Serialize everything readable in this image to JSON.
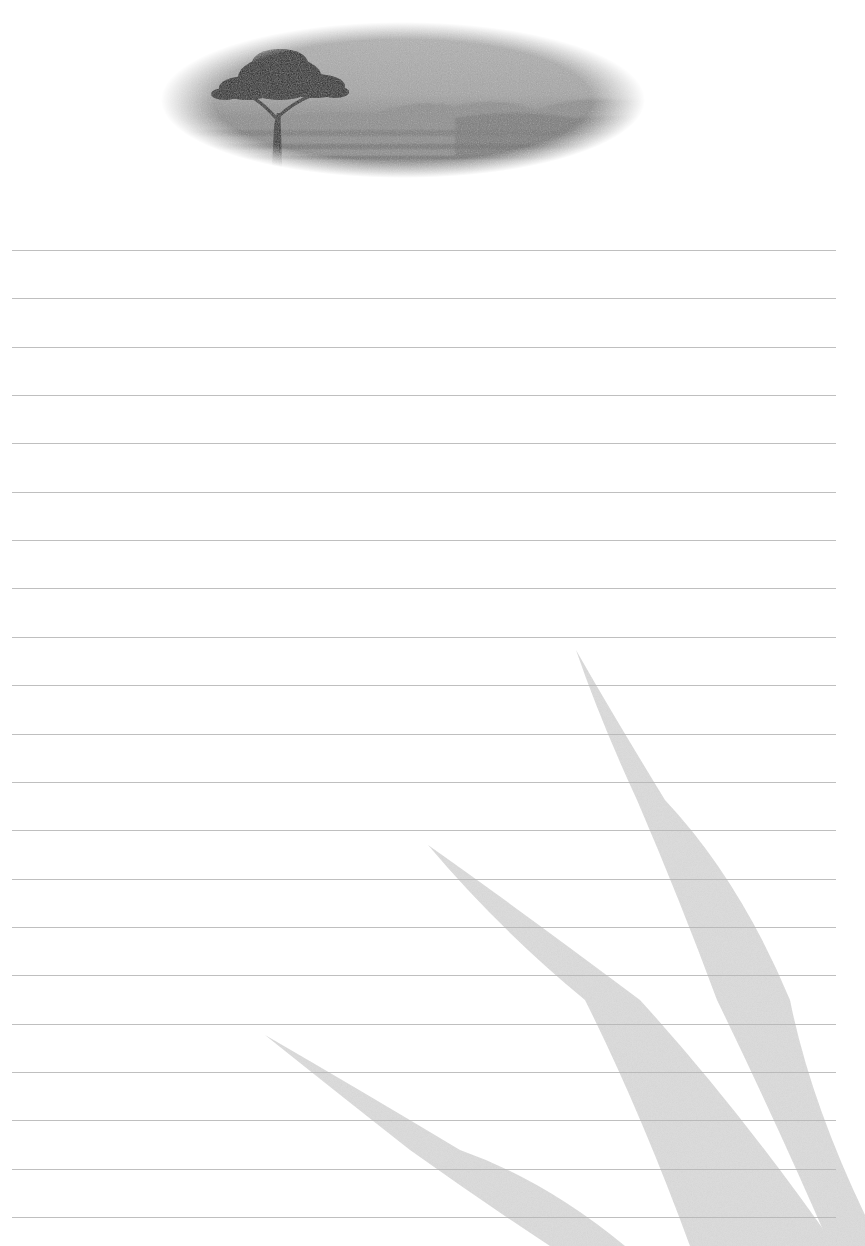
{
  "document": {
    "type": "lined-stationery",
    "header_image_alt": "Acacia tree on savanna landscape (oval vignette)",
    "background_decoration": "Three grey grass blades in lower-right"
  },
  "lines": {
    "count": 21,
    "first_y": 250,
    "spacing": 48.35,
    "left": 12,
    "right": 836,
    "color": "#b4b4b4"
  },
  "colors": {
    "paper": "#ffffff",
    "grass_blade": "#dcdcdc",
    "image_sky": "#a9a9a9",
    "image_ground": "#7a7a7a",
    "tree": "#1e1e1e"
  }
}
